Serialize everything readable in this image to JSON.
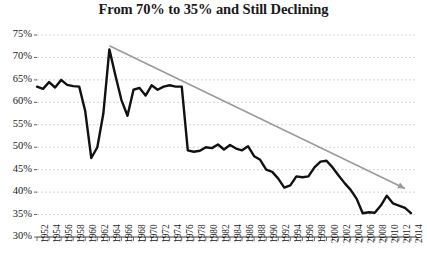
{
  "chart_data": {
    "type": "line",
    "title": "From 70% to 35% and Still Declining",
    "xlabel": "",
    "ylabel": "",
    "ylim": [
      30,
      75
    ],
    "xlim": [
      1952,
      2015
    ],
    "grid": true,
    "legend": "none",
    "y_ticks": [
      "75%",
      "70%",
      "65%",
      "60%",
      "55%",
      "50%",
      "45%",
      "40%",
      "35%",
      "30%"
    ],
    "y_tick_values": [
      75,
      70,
      65,
      60,
      55,
      50,
      45,
      40,
      35,
      30
    ],
    "x_ticks": [
      "1952",
      "1954",
      "1956",
      "1958",
      "1960",
      "1962",
      "1964",
      "1966",
      "1968",
      "1970",
      "1972",
      "1974",
      "1976",
      "1978",
      "1980",
      "1982",
      "1984",
      "1986",
      "1988",
      "1990",
      "1992",
      "1994",
      "1996",
      "1998",
      "2000",
      "2002",
      "2004",
      "2006",
      "2008",
      "2010",
      "2012",
      "2014"
    ],
    "x": [
      1952,
      1953,
      1954,
      1955,
      1956,
      1957,
      1958,
      1959,
      1960,
      1961,
      1962,
      1963,
      1964,
      1965,
      1966,
      1967,
      1968,
      1969,
      1970,
      1971,
      1972,
      1973,
      1974,
      1975,
      1976,
      1977,
      1978,
      1979,
      1980,
      1981,
      1982,
      1983,
      1984,
      1985,
      1986,
      1987,
      1988,
      1989,
      1990,
      1991,
      1992,
      1993,
      1994,
      1995,
      1996,
      1997,
      1998,
      1999,
      2000,
      2001,
      2002,
      2003,
      2004,
      2005,
      2006,
      2007,
      2008,
      2009,
      2010,
      2011,
      2012,
      2013,
      2014
    ],
    "series": [
      {
        "name": "Value",
        "color": "#111111",
        "values": [
          63.5,
          63.0,
          64.5,
          63.3,
          65.0,
          63.9,
          63.6,
          63.5,
          58.0,
          47.6,
          50.0,
          57.5,
          71.8,
          66.0,
          60.5,
          57.0,
          62.8,
          63.2,
          61.5,
          63.8,
          62.8,
          63.5,
          63.8,
          63.5,
          63.5,
          49.3,
          49.0,
          49.2,
          50.0,
          49.8,
          50.6,
          49.5,
          50.5,
          49.7,
          49.3,
          50.2,
          48.0,
          47.2,
          45.0,
          44.5,
          43.0,
          41.0,
          41.5,
          43.5,
          43.3,
          43.5,
          45.5,
          46.8,
          47.0,
          45.5,
          43.7,
          42.0,
          40.5,
          38.5,
          35.3,
          35.5,
          35.4,
          37.0,
          39.2,
          37.5,
          37.0,
          36.5,
          35.3
        ]
      }
    ],
    "trendline": {
      "name": "Trend",
      "color": "#9a9a9a",
      "start": {
        "x": 1964,
        "y": 72.6
      },
      "end": {
        "x": 2013,
        "y": 40.8
      },
      "arrow_end": true
    }
  }
}
